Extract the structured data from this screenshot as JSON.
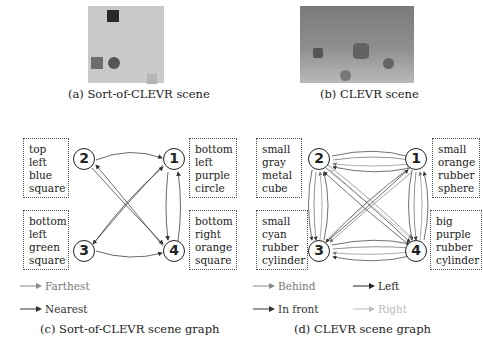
{
  "panels": {
    "a": {
      "caption": "(a) Sort-of-CLEVR scene",
      "background": "#c9c9c9",
      "objects": [
        {
          "shape": "square",
          "color": "#2a2a2a",
          "x": 19,
          "y": 4,
          "size": 12
        },
        {
          "shape": "square",
          "color": "#6e6e6e",
          "x": 3,
          "y": 51,
          "size": 12
        },
        {
          "shape": "circle",
          "color": "#555555",
          "x": 20,
          "y": 51,
          "size": 12
        },
        {
          "shape": "square",
          "color": "#b5b5b5",
          "x": 59,
          "y": 68,
          "size": 10
        }
      ]
    },
    "b": {
      "caption": "(b) CLEVR scene",
      "objects": [
        {
          "shape": "cube",
          "color": "#5a5a5a",
          "x": 13,
          "y": 42,
          "size": 10
        },
        {
          "shape": "cylinder",
          "color": "#666666",
          "x": 53,
          "y": 35,
          "size": 16
        },
        {
          "shape": "sphere",
          "color": "#6a6a6a",
          "x": 83,
          "y": 52,
          "size": 11
        },
        {
          "shape": "sphere",
          "color": "#7a7a7a",
          "x": 40,
          "y": 64,
          "size": 11
        }
      ]
    },
    "c": {
      "caption": "(c) Sort-of-CLEVR scene graph",
      "nodes": [
        {
          "id": "1",
          "label": "1"
        },
        {
          "id": "2",
          "label": "2"
        },
        {
          "id": "3",
          "label": "3"
        },
        {
          "id": "4",
          "label": "4"
        }
      ],
      "descriptions": {
        "node2": [
          "top left",
          "blue",
          "square"
        ],
        "node1": [
          "bottom",
          "left",
          "purple",
          "circle"
        ],
        "node3": [
          "bottom",
          "left",
          "green",
          "square"
        ],
        "node4": [
          "bottom",
          "right",
          "orange",
          "square"
        ]
      },
      "legend": [
        {
          "label": "Farthest",
          "color": "#888888"
        },
        {
          "label": "Nearest",
          "color": "#333333"
        }
      ]
    },
    "d": {
      "caption": "(d) CLEVR scene graph",
      "nodes": [
        {
          "id": "1",
          "label": "1"
        },
        {
          "id": "2",
          "label": "2"
        },
        {
          "id": "3",
          "label": "3"
        },
        {
          "id": "4",
          "label": "4"
        }
      ],
      "descriptions": {
        "node2": [
          "small",
          "gray",
          "metal",
          "cube"
        ],
        "node1": [
          "small",
          "orange",
          "rubber",
          "sphere"
        ],
        "node3": [
          "small",
          "cyan",
          "rubber",
          "cylinder"
        ],
        "node4": [
          "big",
          "purple",
          "rubber",
          "cylinder"
        ]
      },
      "legend": [
        {
          "label": "Behind",
          "color": "#888888"
        },
        {
          "label": "Left",
          "color": "#222222"
        },
        {
          "label": "In front",
          "color": "#333333"
        },
        {
          "label": "Right",
          "color": "#bbbbbb"
        }
      ]
    }
  }
}
